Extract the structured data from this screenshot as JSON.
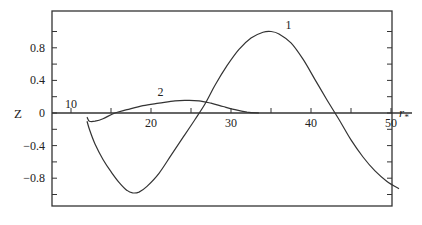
{
  "chart_data": {
    "type": "line",
    "title": "",
    "xlabel": "r*",
    "ylabel": "Z",
    "xlim": [
      7.5,
      51
    ],
    "ylim": [
      -1.15,
      1.15
    ],
    "grid": false,
    "legend": "inline curve labels",
    "x_ticks": [
      10,
      15,
      20,
      25,
      30,
      35,
      40,
      45,
      50
    ],
    "x_tick_labels": [
      "10",
      "20",
      "30",
      "40",
      "50"
    ],
    "x_tick_label_values": [
      10,
      20,
      30,
      40,
      50
    ],
    "y_ticks": [
      1.0,
      0.8,
      0.6,
      0.4,
      0.2,
      0,
      -0.2,
      -0.4,
      -0.6,
      -0.8,
      -1.0
    ],
    "y_tick_labels": [
      "0.8",
      "0.4",
      "0",
      "-0.4",
      "-0.8"
    ],
    "y_tick_label_values": [
      0.8,
      0.4,
      0,
      -0.4,
      -0.8
    ],
    "series": [
      {
        "name": "1",
        "x": [
          12,
          12.3,
          13,
          14,
          15,
          16,
          17,
          17.7,
          18.5,
          19.5,
          21,
          22.5,
          24,
          25.5,
          26.8,
          28,
          29.5,
          31,
          32.5,
          34,
          35,
          36,
          37.5,
          39,
          40.5,
          42,
          43.5,
          45,
          46.5,
          48,
          49.5,
          51
        ],
        "y": [
          -0.1,
          -0.2,
          -0.38,
          -0.57,
          -0.72,
          -0.85,
          -0.95,
          -0.98,
          -0.97,
          -0.9,
          -0.74,
          -0.52,
          -0.3,
          -0.08,
          0.12,
          0.34,
          0.58,
          0.78,
          0.92,
          0.99,
          1.0,
          0.97,
          0.86,
          0.66,
          0.41,
          0.16,
          -0.08,
          -0.33,
          -0.54,
          -0.71,
          -0.84,
          -0.93
        ]
      },
      {
        "name": "2",
        "x": [
          12,
          12.3,
          13,
          14,
          15.5,
          17,
          19,
          21,
          23,
          24.5,
          26,
          27.5,
          29,
          30.5,
          32,
          33.5
        ],
        "y": [
          -0.05,
          -0.1,
          -0.1,
          -0.07,
          0.0,
          0.04,
          0.09,
          0.12,
          0.15,
          0.155,
          0.15,
          0.12,
          0.08,
          0.04,
          0.01,
          0.0
        ]
      }
    ],
    "annotations": [
      {
        "text": "1",
        "x": 37.2,
        "y": 1.03
      },
      {
        "text": "2",
        "x": 21.2,
        "y": 0.21
      }
    ]
  },
  "labels": {
    "y_axis": "Z",
    "x_axis_main": "r",
    "x_axis_sub": "*"
  }
}
